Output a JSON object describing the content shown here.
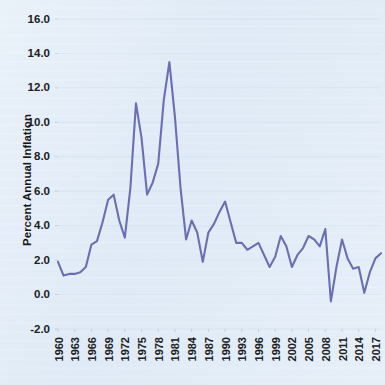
{
  "chart_data": {
    "type": "line",
    "title": "",
    "xlabel": "",
    "ylabel": "Percent Annual Inflation",
    "xlim": [
      1960,
      2018
    ],
    "ylim": [
      -2.0,
      16.0
    ],
    "grid": true,
    "legend": false,
    "legend_position": "none",
    "line_color": "#6a6fb4",
    "background_color": "#e3edf7",
    "text_color": "#20201f",
    "gridline_color": "#cfdeee",
    "ytick_labels": [
      "-2.0",
      "0.0",
      "2.0",
      "4.0",
      "6.0",
      "8.0",
      "10.0",
      "12.0",
      "14.0",
      "16.0"
    ],
    "ytick_values": [
      -2.0,
      0.0,
      2.0,
      4.0,
      6.0,
      8.0,
      10.0,
      12.0,
      14.0,
      16.0
    ],
    "xtick_labels": [
      "1960",
      "1963",
      "1966",
      "1969",
      "1972",
      "1975",
      "1978",
      "1981",
      "1984",
      "1987",
      "1990",
      "1993",
      "1996",
      "1999",
      "2002",
      "2005",
      "2008",
      "2011",
      "2014",
      "2017"
    ],
    "xtick_values": [
      1960,
      1963,
      1966,
      1969,
      1972,
      1975,
      1978,
      1981,
      1984,
      1987,
      1990,
      1993,
      1996,
      1999,
      2002,
      2005,
      2008,
      2011,
      2014,
      2017
    ],
    "x": [
      1960,
      1961,
      1962,
      1963,
      1964,
      1965,
      1966,
      1967,
      1968,
      1969,
      1970,
      1971,
      1972,
      1973,
      1974,
      1975,
      1976,
      1977,
      1978,
      1979,
      1980,
      1981,
      1982,
      1983,
      1984,
      1985,
      1986,
      1987,
      1988,
      1989,
      1990,
      1991,
      1992,
      1993,
      1994,
      1995,
      1996,
      1997,
      1998,
      1999,
      2000,
      2001,
      2002,
      2003,
      2004,
      2005,
      2006,
      2007,
      2008,
      2009,
      2010,
      2011,
      2012,
      2013,
      2014,
      2015,
      2016,
      2017,
      2018
    ],
    "values": [
      1.9,
      1.1,
      1.2,
      1.2,
      1.3,
      1.6,
      2.9,
      3.1,
      4.2,
      5.5,
      5.8,
      4.3,
      3.3,
      6.2,
      11.1,
      9.1,
      5.8,
      6.5,
      7.6,
      11.3,
      13.5,
      10.3,
      6.2,
      3.2,
      4.3,
      3.6,
      1.9,
      3.6,
      4.1,
      4.8,
      5.4,
      4.2,
      3.0,
      3.0,
      2.6,
      2.8,
      3.0,
      2.3,
      1.6,
      2.2,
      3.4,
      2.8,
      1.6,
      2.3,
      2.7,
      3.4,
      3.2,
      2.8,
      3.8,
      -0.4,
      1.6,
      3.2,
      2.1,
      1.5,
      1.6,
      0.1,
      1.3,
      2.1,
      2.4
    ],
    "series": [
      {
        "name": "Percent Annual Inflation",
        "values": [
          1.9,
          1.1,
          1.2,
          1.2,
          1.3,
          1.6,
          2.9,
          3.1,
          4.2,
          5.5,
          5.8,
          4.3,
          3.3,
          6.2,
          11.1,
          9.1,
          5.8,
          6.5,
          7.6,
          11.3,
          13.5,
          10.3,
          6.2,
          3.2,
          4.3,
          3.6,
          1.9,
          3.6,
          4.1,
          4.8,
          5.4,
          4.2,
          3.0,
          3.0,
          2.6,
          2.8,
          3.0,
          2.3,
          1.6,
          2.2,
          3.4,
          2.8,
          1.6,
          2.3,
          2.7,
          3.4,
          3.2,
          2.8,
          3.8,
          -0.4,
          1.6,
          3.2,
          2.1,
          1.5,
          1.6,
          0.1,
          1.3,
          2.1,
          2.4
        ]
      }
    ],
    "annotations": []
  }
}
